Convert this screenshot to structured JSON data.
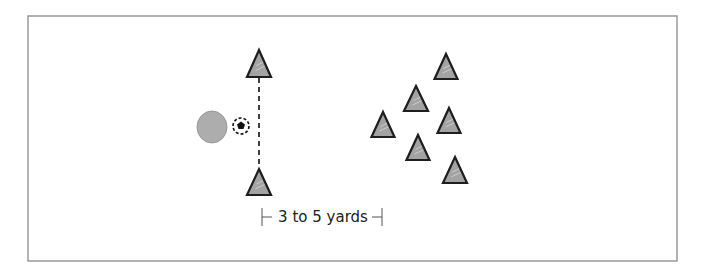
{
  "diagram": {
    "frame": {
      "x": 28,
      "y": 16,
      "width": 649,
      "height": 245,
      "border_color": "#8a8a8a"
    },
    "colors": {
      "cone_fill": "#a3a3a3",
      "cone_stroke": "#1e1e1e",
      "player_fill": "#adadad",
      "ball_color": "#111111"
    },
    "player": {
      "cx": 212,
      "cy": 127,
      "rx": 15,
      "ry": 16,
      "icon": "player-circle"
    },
    "ball": {
      "cx": 241,
      "cy": 126,
      "r": 8,
      "icon": "soccer-ball"
    },
    "gate": {
      "line": {
        "x": 259,
        "y1": 78,
        "y2": 167,
        "style": "dashed"
      },
      "cones": [
        {
          "apex_x": 259,
          "apex_y": 50,
          "base_y": 77,
          "half_width": 12
        },
        {
          "apex_x": 259,
          "apex_y": 169,
          "base_y": 195,
          "half_width": 12
        }
      ]
    },
    "scattered_cones": [
      {
        "apex_x": 446,
        "apex_y": 54,
        "base_y": 79,
        "half_width": 11.5
      },
      {
        "apex_x": 416,
        "apex_y": 86,
        "base_y": 111,
        "half_width": 12
      },
      {
        "apex_x": 383,
        "apex_y": 112,
        "base_y": 137,
        "half_width": 11.5
      },
      {
        "apex_x": 449,
        "apex_y": 108,
        "base_y": 133,
        "half_width": 11.5
      },
      {
        "apex_x": 418,
        "apex_y": 135,
        "base_y": 160,
        "half_width": 11.5
      },
      {
        "apex_x": 455,
        "apex_y": 157,
        "base_y": 183,
        "half_width": 12
      }
    ],
    "distance_label": {
      "text": "3 to 5 yards",
      "x": 323,
      "y": 222,
      "left_bracket_x": 262,
      "right_bracket_x": 382
    }
  }
}
